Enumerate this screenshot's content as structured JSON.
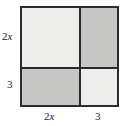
{
  "figure": {
    "type": "area-model-square",
    "colors": {
      "outline": "#2b2b2b",
      "light_fill": "#ececea",
      "medium_fill": "#c6c6c4",
      "label_text": "#1a1a1a",
      "background": "#ffffff"
    },
    "regions": [
      {
        "position": "top-left",
        "width_label": "2x",
        "height_label": "2x",
        "shade": "light"
      },
      {
        "position": "top-right",
        "width_label": "3",
        "height_label": "2x",
        "shade": "medium"
      },
      {
        "position": "bottom-left",
        "width_label": "2x",
        "height_label": "3",
        "shade": "medium"
      },
      {
        "position": "bottom-right",
        "width_label": "3",
        "height_label": "3",
        "shade": "light"
      }
    ],
    "labels": {
      "left_top_coefficient": "2",
      "left_top_variable": "x",
      "left_bottom": "3",
      "bottom_left_coefficient": "2",
      "bottom_left_variable": "x",
      "bottom_right": "3"
    }
  }
}
